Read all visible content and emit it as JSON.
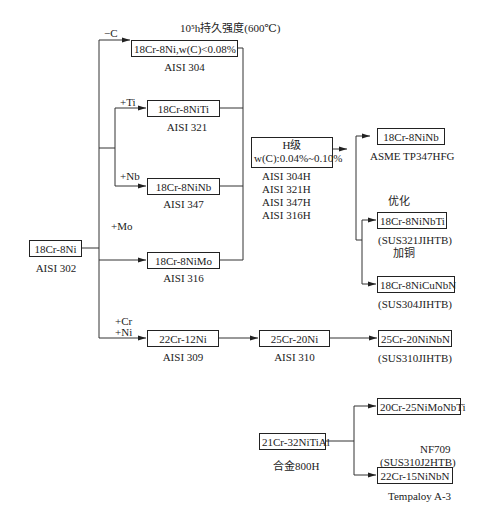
{
  "title": "10⁵h持久强度(600℃)",
  "nodes": {
    "base": {
      "box": "18Cr-8Ni",
      "grade": "AISI 302"
    },
    "n304": {
      "box": "18Cr-8Ni,w(C)<0.08%",
      "grade": "AISI 304"
    },
    "n321": {
      "box": "18Cr-8NiTi",
      "grade": "AISI 321"
    },
    "n347": {
      "box": "18Cr-8NiNb",
      "grade": "AISI 347"
    },
    "n316": {
      "box": "18Cr-8NiMo",
      "grade": "AISI 316"
    },
    "hgrade": {
      "line1": "H级",
      "line2": "w(C):0.04%~0.10%",
      "grades": [
        "AISI 304H",
        "AISI 321H",
        "AISI 347H",
        "AISI 316H"
      ]
    },
    "tp347": {
      "box": "18Cr-8NiNb",
      "grade": "ASME TP347HFG"
    },
    "sus321": {
      "box": "18Cr-8NiNbTi",
      "grade": "(SUS321JIHTB)"
    },
    "sus304": {
      "box": "18Cr-8NiCuNbN",
      "grade": "(SUS304JIHTB)"
    },
    "n309": {
      "box": "22Cr-12Ni",
      "grade": "AISI 309"
    },
    "n310": {
      "box": "25Cr-20Ni",
      "grade": "AISI 310"
    },
    "sus310": {
      "box": "25Cr-20NiNbN",
      "grade": "(SUS310JIHTB)"
    },
    "a800": {
      "box": "21Cr-32NiTiAl",
      "grade": "合金800H"
    },
    "nimo": {
      "box": "20Cr-25NiMoNbTi"
    },
    "nf709": {
      "box": "22Cr-15NiNbN",
      "grade_above_1": "NF709",
      "grade_above_2": "(SUS310J2HTB)",
      "grade": "Tempaloy  A-3"
    }
  },
  "edge_labels": {
    "minus_c": "−C",
    "plus_ti": "+Ti",
    "plus_nb": "+Nb",
    "plus_mo": "+Mo",
    "plus_cr": "+Cr",
    "plus_ni": "+Ni",
    "optimize": "优化",
    "add_copper": "加铜"
  }
}
